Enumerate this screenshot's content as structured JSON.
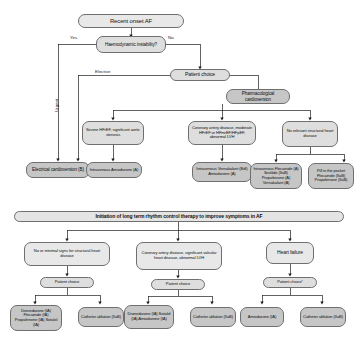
{
  "diagram": {
    "title_top": "Recent onset AF",
    "title_bottom": "Initiation of long term rhythm control therapy to improve symptoms in AF"
  },
  "top_panel": {
    "root": "Recent onset AF",
    "decision": "Haemodynamic instability?",
    "branch_yes": "Yes",
    "branch_no": "No",
    "branch_urgent": "Urgent",
    "branch_elective": "Elective",
    "patient_choice": "Patient choice",
    "pharmacological": "Pharmacological cardioversion",
    "conditions": [
      "Severe HFrEF, significant aortic stenosis",
      "Coronary artery disease, moderate HFrEF or HFmrEF/HFpEF, abnormal LVH",
      "No relevant structural heart disease"
    ],
    "treatments": [
      "Electrical cardioversion (B)",
      "Intravenous Amiodarone (A)",
      "Intravenous Vernakalant (BdI) Amiodarone (A)",
      "Intravenous Flecainide (A) Ibutilide (IIaB) Propafenone (A) Vernakalant (A)",
      "Pill in the pocket Flecainide (IIaB) Propafenone (IIaB)"
    ]
  },
  "bottom_panel": {
    "banner": "Initiation of long term rhythm control therapy to improve symptoms in AF",
    "columns": [
      {
        "condition": "No or minimal signs for structural heart disease",
        "choice": "Patient choice",
        "options": [
          "Dronedarone (IA) Flecainide (IA) Propafenone (IA) Sotalol (IA)",
          "Catheter ablation (IIaB)"
        ]
      },
      {
        "condition": "Coronary artery disease, significant valvular heart disease, abnormal LVH",
        "choice": "Patient choice",
        "options": [
          "Dronedarone (IA) Sotalol (IA) Amiodarone (IA)",
          "Catheter ablation (IIaB)"
        ]
      },
      {
        "condition": "Heart failure",
        "choice": "Patient choice",
        "options": [
          "Amiodarone (IA)",
          "Catheter ablation (IIaB)"
        ]
      }
    ],
    "marks": {
      "choice_star": "*",
      "sup_a": "a",
      "sup_b": "b",
      "sup_c": "c"
    }
  },
  "colors": {
    "node_fill": "#d4d4d4",
    "node_fill_light": "#e8e8e8",
    "node_stroke": "#6f6f6f",
    "connector": "#1f1f1f",
    "text": "#101010",
    "background": "#ffffff"
  }
}
